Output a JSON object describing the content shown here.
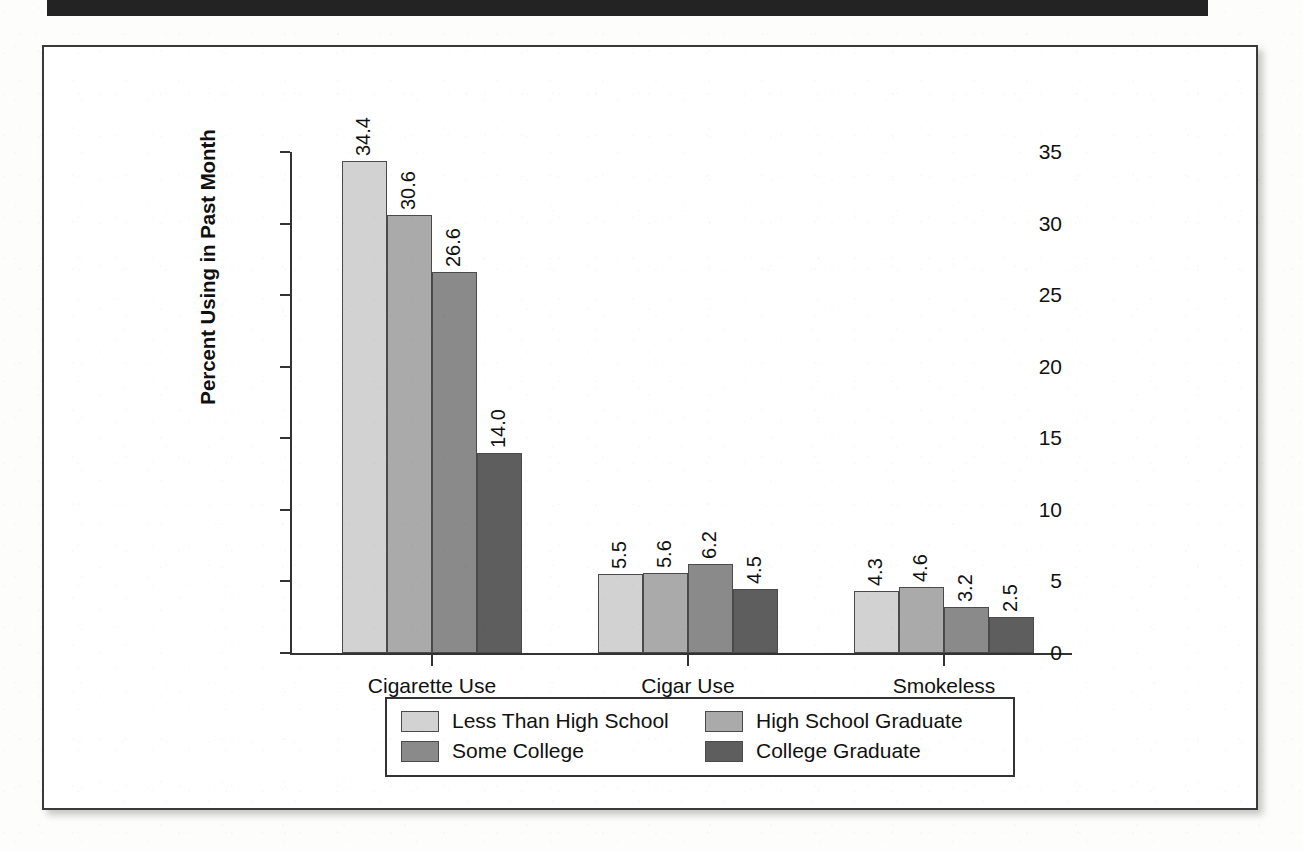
{
  "chart_data": {
    "type": "bar",
    "title": "",
    "xlabel": "",
    "ylabel": "Percent Using in Past Month",
    "ylim": [
      0,
      35
    ],
    "yticks": [
      "0",
      "5",
      "10",
      "15",
      "20",
      "25",
      "30",
      "35"
    ],
    "grid": false,
    "legend_position": "bottom",
    "categories": [
      "Cigarette Use",
      "Cigar Use",
      "Smokeless\nTobacco Use"
    ],
    "series": [
      {
        "name": "Less Than High School",
        "color": "#d2d2d2",
        "values": [
          34.4,
          5.5,
          4.3
        ]
      },
      {
        "name": "High School Graduate",
        "color": "#aaaaaa",
        "values": [
          30.6,
          5.6,
          4.6
        ]
      },
      {
        "name": "Some College",
        "color": "#8a8a8a",
        "values": [
          26.6,
          6.2,
          3.2
        ]
      },
      {
        "name": "College Graduate",
        "color": "#5e5e5e",
        "values": [
          14.0,
          4.5,
          2.5
        ]
      }
    ],
    "value_labels": [
      [
        "34.4",
        "30.6",
        "26.6",
        "14.0"
      ],
      [
        "5.5",
        "5.6",
        "6.2",
        "4.5"
      ],
      [
        "4.3",
        "4.6",
        "3.2",
        "2.5"
      ]
    ]
  },
  "legend": {
    "items": [
      {
        "label": "Less Than High School"
      },
      {
        "label": "High School Graduate"
      },
      {
        "label": "Some College"
      },
      {
        "label": "College Graduate"
      }
    ]
  },
  "colors": {
    "band": "#232323",
    "panel_border": "#3a3a3a",
    "axis": "#333333",
    "text": "#111111"
  }
}
